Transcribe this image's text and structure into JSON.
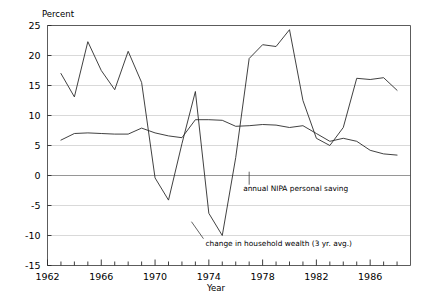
{
  "chart_data": {
    "type": "line",
    "title": "",
    "xlabel": "Year",
    "ylabel": "Percent",
    "xlim": [
      1962,
      1989
    ],
    "ylim": [
      -15,
      25
    ],
    "ytick_values": [
      25,
      20,
      15,
      10,
      5,
      0,
      -5,
      -10,
      -15
    ],
    "ytick_labels": [
      "25",
      "20",
      "15",
      "10",
      "5",
      "0",
      "-5",
      "-10",
      "-15"
    ],
    "xtick_values": [
      1962,
      1963,
      1964,
      1965,
      1966,
      1967,
      1968,
      1969,
      1970,
      1971,
      1972,
      1973,
      1974,
      1975,
      1976,
      1977,
      1978,
      1979,
      1980,
      1981,
      1982,
      1983,
      1984,
      1985,
      1986,
      1987,
      1988
    ],
    "xtick_labels": [
      "1962",
      "1966",
      "1970",
      "1974",
      "1978",
      "1982",
      "1986"
    ],
    "xtick_labeled_values": [
      1962,
      1966,
      1970,
      1974,
      1978,
      1982,
      1986
    ],
    "grid": true,
    "grid_axis": "y",
    "legend": "none",
    "zero_line": 0,
    "series": [
      {
        "name": "change in household wealth (3 yr. avg.)",
        "x": [
          1963,
          1964,
          1965,
          1966,
          1967,
          1968,
          1969,
          1970,
          1971,
          1972,
          1973,
          1974,
          1975,
          1976,
          1977,
          1978,
          1979,
          1980,
          1981,
          1982,
          1983,
          1984,
          1985,
          1986,
          1987,
          1988
        ],
        "values": [
          17.0,
          13.1,
          22.3,
          17.5,
          14.3,
          20.7,
          15.5,
          -0.4,
          -4.1,
          5.3,
          14.0,
          -6.3,
          -10.0,
          3.0,
          19.5,
          21.8,
          21.5,
          24.3,
          12.5,
          6.2,
          5.0,
          8.0,
          16.2,
          16.0,
          16.3,
          14.2
        ]
      },
      {
        "name": "annual NIPA personal saving",
        "x": [
          1963,
          1964,
          1965,
          1966,
          1967,
          1968,
          1969,
          1970,
          1971,
          1972,
          1973,
          1974,
          1975,
          1976,
          1977,
          1978,
          1979,
          1980,
          1981,
          1982,
          1983,
          1984,
          1985,
          1986,
          1987,
          1988
        ],
        "values": [
          5.9,
          7.0,
          7.1,
          7.0,
          6.9,
          6.9,
          7.9,
          7.1,
          6.6,
          6.3,
          9.3,
          9.3,
          9.2,
          8.2,
          8.3,
          8.5,
          8.4,
          8.0,
          8.3,
          7.0,
          5.7,
          6.2,
          5.7,
          4.2,
          3.6,
          3.4
        ]
      }
    ],
    "annotations": [
      {
        "name": "annual-nipa-personal-saving",
        "text": "annual NIPA personal saving",
        "x": 1977.0,
        "y": -2.2
      },
      {
        "name": "change-in-household-wealth",
        "text": "change in household wealth (3 yr. avg.)",
        "x": 1973.6,
        "y": -11.2
      }
    ]
  }
}
